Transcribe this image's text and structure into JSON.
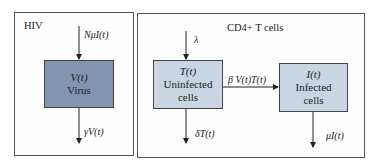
{
  "panels": {
    "hiv": {
      "title": "HIV"
    },
    "cd4": {
      "title": "CD4+ T cells"
    }
  },
  "nodes": {
    "virus": {
      "symbol": "V(t)",
      "label": "Virus",
      "fill": "#8294b0"
    },
    "uninfected": {
      "symbol": "T(t)",
      "label_line1": "Uninfected",
      "label_line2": "cells",
      "fill": "#c9d6e2"
    },
    "infected": {
      "symbol": "I(t)",
      "label_line1": "Infected",
      "label_line2": "cells",
      "fill": "#c9d6e2"
    }
  },
  "edges": {
    "virus_in": "NμI(t)",
    "virus_out": "γV(t)",
    "uninfected_in": "λ",
    "uninfected_out": "δT(t)",
    "infection": "β V(t)T(t)",
    "infected_out": "μI(t)"
  }
}
